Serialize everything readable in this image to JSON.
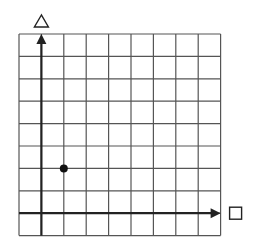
{
  "diagram": {
    "type": "coordinate-grid",
    "grid": {
      "columns": 9,
      "rows": 9,
      "left": 19,
      "top": 34,
      "cell": 22.4,
      "line_color": "#555555"
    },
    "axes": {
      "origin_col": 1,
      "origin_row": 8,
      "x_label_symbol": "square",
      "y_label_symbol": "triangle",
      "color": "#222222"
    },
    "points": [
      {
        "x": 1,
        "y": 2,
        "color": "#111111"
      }
    ]
  }
}
